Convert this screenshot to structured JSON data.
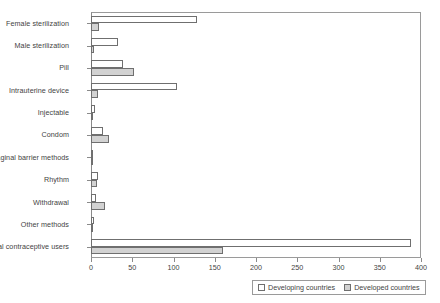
{
  "chart_data": {
    "type": "bar",
    "orientation": "horizontal",
    "title": "",
    "xlabel": "",
    "ylabel": "",
    "xlim": [
      0,
      400
    ],
    "xticks": [
      0,
      50,
      100,
      150,
      200,
      250,
      300,
      350,
      400
    ],
    "grid": false,
    "legend_position": "bottom-right",
    "categories": [
      "Female sterilization",
      "Male sterilization",
      "Pill",
      "Intrauterine device",
      "Injectable",
      "Condom",
      "Vaginal barrier methods",
      "Rhythm",
      "Withdrawal",
      "Other methods",
      "Total contraceptive users"
    ],
    "series": [
      {
        "name": "Developing countries",
        "color": "#ffffff",
        "values": [
          128,
          33,
          39,
          104,
          5,
          14,
          3,
          8,
          6,
          4,
          388
        ]
      },
      {
        "name": "Developed countries",
        "color": "#d2d2d2",
        "values": [
          10,
          4,
          52,
          9,
          1,
          22,
          2,
          7,
          17,
          1,
          160
        ]
      }
    ]
  },
  "legend": {
    "items": [
      {
        "label": "Developing countries",
        "swatch": "developing"
      },
      {
        "label": "Developed countries",
        "swatch": "developed"
      }
    ]
  }
}
